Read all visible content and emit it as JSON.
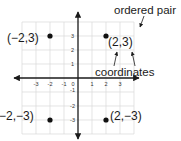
{
  "diagram": {
    "type": "coordinate-plane",
    "origin_px": [
      78,
      78
    ],
    "unit_px": 14,
    "x_ticks": [
      "-3",
      "-2",
      "-1",
      "0",
      "1",
      "2",
      "3"
    ],
    "y_ticks": [
      "3",
      "2",
      "1",
      "-1",
      "-2",
      "-3"
    ],
    "points": [
      {
        "x": -2,
        "y": 3,
        "label": "(−2,3)"
      },
      {
        "x": 2,
        "y": 3,
        "label": "(2,3)"
      },
      {
        "x": -2,
        "y": -3,
        "label": "(−2,−3)"
      },
      {
        "x": 2,
        "y": -3,
        "label": "(2,−3)"
      }
    ],
    "annotations": {
      "ordered_pair": "ordered pair",
      "coordinates": "coordinates"
    },
    "colors": {
      "axis": "#1a1a1a",
      "grid": "#d9d9d9",
      "point": "#111111"
    }
  }
}
